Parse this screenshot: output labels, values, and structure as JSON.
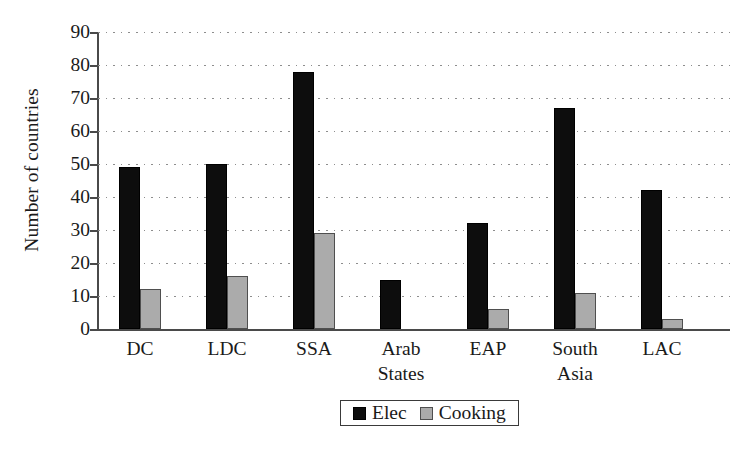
{
  "chart_data": {
    "type": "bar",
    "title": "",
    "xlabel": "",
    "ylabel": "Number of countries",
    "ylim": [
      0,
      90
    ],
    "ytick_step": 10,
    "yticks": [
      90,
      80,
      70,
      60,
      50,
      40,
      30,
      20,
      10,
      0
    ],
    "ytick_labels": [
      "90",
      "80",
      "70",
      "60",
      "50",
      "40",
      "30",
      "20",
      "10",
      "0"
    ],
    "grid": true,
    "grid_axis": "y",
    "grid_style": "dotted",
    "legend_position": "bottom-center",
    "categories": [
      "DC",
      "LDC",
      "SSA",
      "Arab States",
      "EAP",
      "South Asia",
      "LAC"
    ],
    "category_label_lines": [
      [
        "DC"
      ],
      [
        "LDC"
      ],
      [
        "SSA"
      ],
      [
        "Arab",
        "States"
      ],
      [
        "EAP"
      ],
      [
        "South",
        "Asia"
      ],
      [
        "LAC"
      ]
    ],
    "series": [
      {
        "name": "Elec",
        "color": "#0d0d0d",
        "values": [
          49,
          50,
          78,
          15,
          32,
          67,
          42
        ]
      },
      {
        "name": "Cooking",
        "color": "#ababab",
        "values": [
          12,
          16,
          29,
          0,
          6,
          11,
          3
        ]
      }
    ]
  },
  "legend": {
    "items": [
      {
        "label": "Elec",
        "swatch": "elec"
      },
      {
        "label": "Cooking",
        "swatch": "cooking"
      }
    ]
  }
}
